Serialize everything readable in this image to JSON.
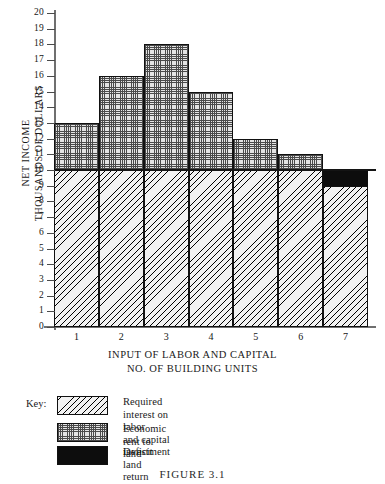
{
  "chart_data": {
    "type": "bar",
    "title": "",
    "subtitle": "",
    "xlabel": "INPUT OF LABOR AND CAPITAL",
    "xlabel2": "NO. OF BUILDING UNITS",
    "ylabel": "NET INCOME",
    "ylabel2": "THOUSANDS OF DOLLARS",
    "categories": [
      "1",
      "2",
      "3",
      "4",
      "5",
      "6",
      "7"
    ],
    "ylim": [
      0,
      20
    ],
    "ytick_step": 1,
    "yticks": [
      20,
      19,
      18,
      17,
      16,
      15,
      14,
      13,
      12,
      11,
      10,
      9,
      8,
      7,
      6,
      5,
      4,
      3,
      2,
      1,
      0
    ],
    "grid": false,
    "legend_position": "below-axes",
    "stacked": true,
    "reference_line": 10,
    "totals": [
      13,
      16,
      18,
      15,
      12,
      11,
      9
    ],
    "series": [
      {
        "name": "Required interest on labor and capital investment",
        "pattern": "diagonal-hatch",
        "values": [
          10,
          10,
          10,
          10,
          10,
          10,
          9
        ]
      },
      {
        "name": "Economic rent to land",
        "pattern": "stipple-dots",
        "values": [
          3,
          6,
          8,
          5,
          2,
          1,
          0
        ]
      },
      {
        "name": "Deficit land return",
        "pattern": "solid-black",
        "values": [
          0,
          0,
          0,
          0,
          0,
          0,
          1
        ]
      }
    ],
    "bars": [
      {
        "category": "1",
        "interest_top": 10,
        "rent_top": 13,
        "deficit_from": null,
        "deficit_to": null
      },
      {
        "category": "2",
        "interest_top": 10,
        "rent_top": 16,
        "deficit_from": null,
        "deficit_to": null
      },
      {
        "category": "3",
        "interest_top": 10,
        "rent_top": 18,
        "deficit_from": null,
        "deficit_to": null
      },
      {
        "category": "4",
        "interest_top": 10,
        "rent_top": 15,
        "deficit_from": null,
        "deficit_to": null
      },
      {
        "category": "5",
        "interest_top": 10,
        "rent_top": 12,
        "deficit_from": null,
        "deficit_to": null
      },
      {
        "category": "6",
        "interest_top": 10,
        "rent_top": 11,
        "deficit_from": null,
        "deficit_to": null
      },
      {
        "category": "7",
        "interest_top": 9,
        "rent_top": 9,
        "deficit_from": 9,
        "deficit_to": 10
      }
    ],
    "colors": {
      "axis": "#6f6f6f",
      "bar_outline": "#111111",
      "deficit": "#0d0d0d",
      "reference_line": "#141414",
      "background": "#ffffff"
    }
  },
  "legend": {
    "key_label": "Key:",
    "items": [
      {
        "swatch": "diagonal-hatch",
        "text": "Required interest on labor\nand capital investment"
      },
      {
        "swatch": "stipple-dots",
        "text": "Economic rent to land"
      },
      {
        "swatch": "solid-black",
        "text": "Deficit land return"
      }
    ]
  },
  "caption": {
    "text": "FIGURE 3.1"
  }
}
